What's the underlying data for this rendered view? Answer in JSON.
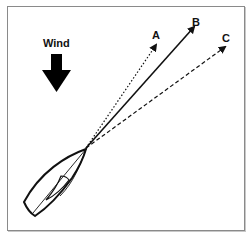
{
  "diagram": {
    "wind_label": "Wind",
    "courses": [
      {
        "label": "A",
        "style": "dotted"
      },
      {
        "label": "B",
        "style": "solid"
      },
      {
        "label": "C",
        "style": "dashed"
      }
    ],
    "colors": {
      "line": "#111111",
      "frame": "#8a8a8a",
      "background": "#ffffff"
    }
  }
}
